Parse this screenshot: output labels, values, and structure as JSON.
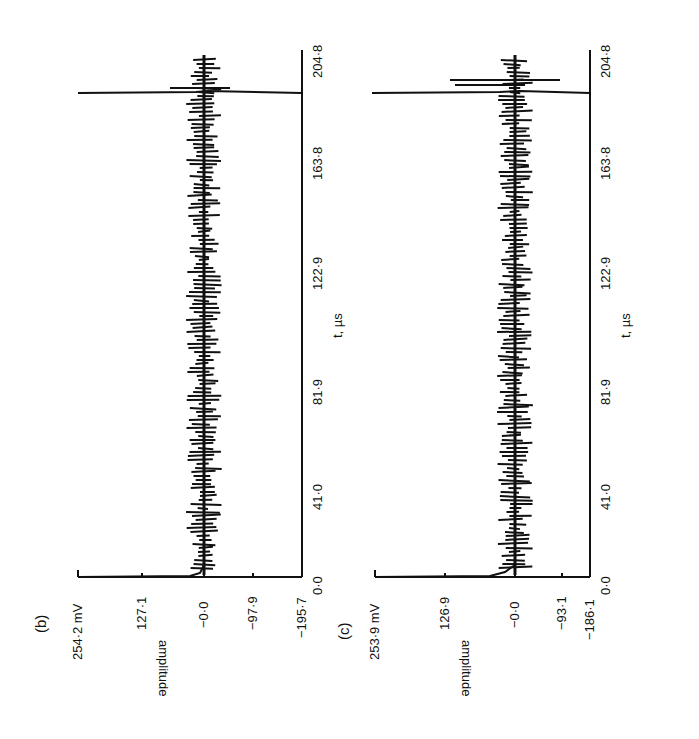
{
  "chart_data": [
    {
      "type": "line",
      "panel_label": "(b)",
      "orientation": "rotated 90° counter-clockwise",
      "xlabel": "t, µs",
      "ylabel": "amplitude",
      "x_ticks": [
        "0·0",
        "41·0",
        "81·9",
        "122·9",
        "163·8",
        "204·8"
      ],
      "x_range": [
        0.0,
        204.8
      ],
      "y_ticks": [
        "254·2 mV",
        "127·1",
        "−0·0",
        "−97·9",
        "−195·7"
      ],
      "y_range": [
        -195.7,
        254.2
      ],
      "description": "Noisy oscillating trace around 0 mV throughout 0–204.8 µs, with a sharp spike at t≈0 and a large positive spike reaching ~254 mV near t≈195 µs",
      "series": [
        {
          "name": "signal (b)",
          "x": [
            0,
            1,
            20,
            41,
            81.9,
            122.9,
            163.8,
            190,
            195,
            196,
            204.8
          ],
          "values": [
            0,
            5,
            20,
            -15,
            12,
            -10,
            15,
            30,
            254.2,
            40,
            0
          ]
        }
      ],
      "grid": false
    },
    {
      "type": "line",
      "panel_label": "(c)",
      "orientation": "rotated 90° counter-clockwise",
      "xlabel": "t, µs",
      "ylabel": "amplitude",
      "x_ticks": [
        "0·0",
        "41·0",
        "81·9",
        "122·9",
        "163·8",
        "204·8"
      ],
      "x_range": [
        0.0,
        204.8
      ],
      "y_ticks": [
        "253·9 mV",
        "126·9",
        "−0·0",
        "−93·1",
        "−186·1"
      ],
      "y_range": [
        -186.1,
        253.9
      ],
      "description": "Noisy oscillating trace around 0 mV, with a small spike at t≈0 and a large positive spike reaching ~254 mV near t≈195 µs accompanied by several oscillations",
      "series": [
        {
          "name": "signal (c)",
          "x": [
            0,
            1,
            20,
            41,
            81.9,
            122.9,
            163.8,
            190,
            195,
            196,
            204.8
          ],
          "values": [
            0,
            8,
            -20,
            15,
            -18,
            14,
            -12,
            60,
            253.9,
            -90,
            0
          ]
        }
      ],
      "grid": false
    }
  ],
  "panels": {
    "b": {
      "label": "(b)",
      "ylabel": "amplitude",
      "xlabel": "t, µs",
      "y_ticks": [
        "254·2 mV",
        "127·1",
        "−0·0",
        "−97·9",
        "−195·7"
      ],
      "x_ticks": [
        "0·0",
        "41·0",
        "81·9",
        "122·9",
        "163·8",
        "204·8"
      ]
    },
    "c": {
      "label": "(c)",
      "ylabel": "amplitude",
      "xlabel": "t, µs",
      "y_ticks": [
        "253·9 mV",
        "126·9",
        "−0·0",
        "−93·1",
        "−186·1"
      ],
      "x_ticks": [
        "0·0",
        "41·0",
        "81·9",
        "122·9",
        "163·8",
        "204·8"
      ]
    }
  },
  "colors": {
    "ink": "#111111",
    "background": "#ffffff"
  }
}
